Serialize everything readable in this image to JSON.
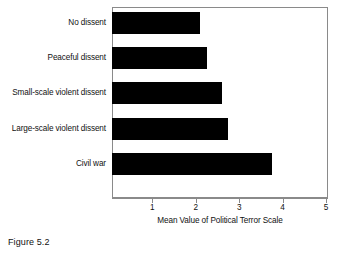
{
  "caption": "Figure 5.2",
  "chart_data": {
    "type": "bar",
    "orientation": "horizontal",
    "title": "",
    "xlabel": "Mean Value of Political Terror Scale",
    "ylabel": "",
    "xlim": [
      0,
      5
    ],
    "xticks": [
      1,
      2,
      3,
      4,
      5
    ],
    "xtick_labels": [
      "1",
      "2",
      "3",
      "4",
      "5"
    ],
    "grid": false,
    "legend": false,
    "bar_color": "#000000",
    "frame_color": "#8a8a8a",
    "categories": [
      "No dissent",
      "Peaceful dissent",
      "Small-scale violent dissent",
      "Large-scale violent dissent",
      "Civil war"
    ],
    "values": [
      2.1,
      2.25,
      2.6,
      2.75,
      3.75
    ]
  }
}
